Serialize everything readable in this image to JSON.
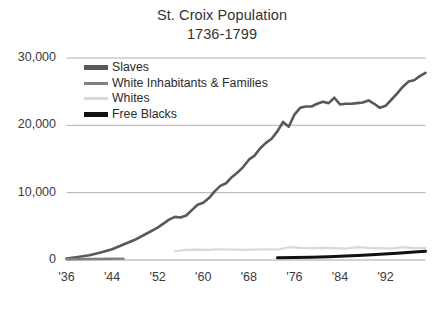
{
  "title": {
    "main": "St. Croix Population",
    "sub": "1736-1799"
  },
  "legend": {
    "position": "inside-top-left",
    "items": [
      {
        "label": "Slaves",
        "color": "#595959",
        "width": "thick"
      },
      {
        "label": "White Inhabitants & Families",
        "color": "#808080",
        "width": "thin"
      },
      {
        "label": "Whites",
        "color": "#d9d9d9",
        "width": "thin"
      },
      {
        "label": "Free Blacks",
        "color": "#111111",
        "width": "thick"
      }
    ]
  },
  "axes": {
    "y_ticks": [
      "0",
      "10,000",
      "20,000",
      "30,000"
    ],
    "x_ticks": [
      "'36",
      "'44",
      "'52",
      "'60",
      "'68",
      "'76",
      "'84",
      "'92"
    ]
  },
  "chart_data": {
    "type": "line",
    "title": "St. Croix Population 1736-1799",
    "subtitle": "1736-1799",
    "xlabel": "",
    "ylabel": "",
    "xlim": [
      1736,
      1799
    ],
    "ylim": [
      0,
      30000
    ],
    "yticks": [
      0,
      10000,
      20000,
      30000
    ],
    "xticks": [
      1736,
      1744,
      1752,
      1760,
      1768,
      1776,
      1784,
      1792
    ],
    "xtick_labels": [
      "'36",
      "'44",
      "'52",
      "'60",
      "'68",
      "'76",
      "'84",
      "'92"
    ],
    "grid": "horizontal",
    "legend": [
      "Slaves",
      "White Inhabitants & Families",
      "Whites",
      "Free Blacks"
    ],
    "series": [
      {
        "name": "Slaves",
        "color": "#595959",
        "x": [
          1736,
          1738,
          1740,
          1742,
          1744,
          1746,
          1748,
          1750,
          1752,
          1754,
          1755,
          1756,
          1757,
          1758,
          1759,
          1760,
          1761,
          1762,
          1763,
          1764,
          1765,
          1766,
          1767,
          1768,
          1769,
          1770,
          1771,
          1772,
          1773,
          1774,
          1775,
          1776,
          1777,
          1778,
          1779,
          1780,
          1781,
          1782,
          1783,
          1784,
          1785,
          1786,
          1787,
          1788,
          1789,
          1790,
          1791,
          1792,
          1793,
          1794,
          1795,
          1796,
          1797,
          1798,
          1799
        ],
        "y": [
          200,
          450,
          700,
          1100,
          1600,
          2300,
          3000,
          3900,
          4800,
          6000,
          6400,
          6300,
          6600,
          7400,
          8200,
          8500,
          9200,
          10200,
          11000,
          11400,
          12300,
          13000,
          13800,
          14900,
          15500,
          16600,
          17400,
          18000,
          19100,
          20500,
          19800,
          21600,
          22600,
          22800,
          22800,
          23200,
          23500,
          23300,
          24100,
          23100,
          23200,
          23200,
          23300,
          23400,
          23700,
          23200,
          22600,
          22900,
          23800,
          24700,
          25700,
          26500,
          26700,
          27300,
          27800
        ]
      },
      {
        "name": "White Inhabitants & Families",
        "color": "#808080",
        "x": [
          1736,
          1740,
          1744,
          1746
        ],
        "y": [
          120,
          150,
          180,
          200
        ]
      },
      {
        "name": "Whites",
        "color": "#d9d9d9",
        "x": [
          1755,
          1757,
          1759,
          1761,
          1763,
          1765,
          1767,
          1769,
          1771,
          1773,
          1775,
          1777,
          1779,
          1781,
          1783,
          1785,
          1787,
          1789,
          1791,
          1793,
          1795,
          1797,
          1799
        ],
        "y": [
          1300,
          1500,
          1550,
          1500,
          1600,
          1550,
          1500,
          1550,
          1600,
          1550,
          1900,
          1800,
          1750,
          1800,
          1750,
          1700,
          1900,
          1800,
          1750,
          1700,
          1900,
          1750,
          1800
        ]
      },
      {
        "name": "Free Blacks",
        "color": "#111111",
        "x": [
          1773,
          1776,
          1779,
          1782,
          1785,
          1788,
          1791,
          1794,
          1797,
          1799
        ],
        "y": [
          350,
          380,
          420,
          500,
          600,
          700,
          850,
          1000,
          1200,
          1300
        ]
      }
    ]
  }
}
